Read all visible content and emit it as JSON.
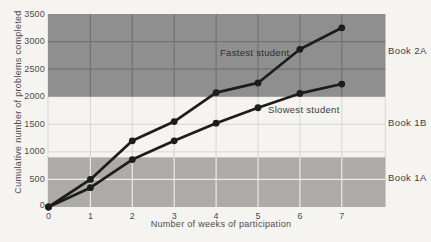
{
  "figure": {
    "background": "#f5f4f1"
  },
  "chart_data": {
    "type": "line",
    "title": "",
    "xlabel": "Number of weeks of participation",
    "ylabel": "Cumulative number of problems completed",
    "x": [
      0,
      1,
      2,
      3,
      4,
      5,
      6,
      7
    ],
    "x_ticks": [
      "0",
      "1",
      "2",
      "3",
      "4",
      "5",
      "6",
      "7"
    ],
    "y_ticks": [
      "0",
      "500",
      "1000",
      "1500",
      "2000",
      "2500",
      "3000",
      "3500"
    ],
    "xlim": [
      0,
      8.05
    ],
    "ylim": [
      0,
      3500
    ],
    "grid": true,
    "legend_position": "inline-labels",
    "series": [
      {
        "name": "Fastest student",
        "values": [
          0,
          500,
          1200,
          1550,
          2075,
          2250,
          2860,
          3250
        ]
      },
      {
        "name": "Slowest student",
        "values": [
          0,
          350,
          860,
          1200,
          1520,
          1800,
          2060,
          2230
        ]
      }
    ],
    "bands": [
      {
        "label": "Book 1A",
        "from": 0,
        "to": 900,
        "shaded": true,
        "color": "#acabaa",
        "grid_color": "#edebe7"
      },
      {
        "label": "Book 1B",
        "from": 900,
        "to": 2000,
        "shaded": false,
        "color": "#f5f4f1",
        "grid_color": "#d9d6d2"
      },
      {
        "label": "Book 2A",
        "from": 2000,
        "to": 3500,
        "shaded": true,
        "color": "#8e8f8e",
        "grid_color": "#747270"
      }
    ],
    "colors": {
      "line": "#1d1d1d",
      "marker": "#1d1d1d",
      "grid_light": "#d9d6d2",
      "text": "#4c4c4c"
    }
  }
}
